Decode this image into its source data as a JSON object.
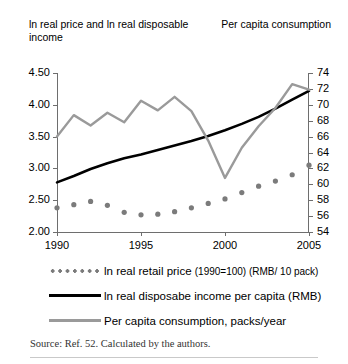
{
  "axis_captions": {
    "left": "ln real price and ln real disposable income",
    "right": "Per capita consumption"
  },
  "source_note": "Source: Ref. 52. Calculated by the authors.",
  "legend": [
    {
      "key": "dotted-marker",
      "label": "ln real retail price ",
      "sublabel": "(1990=100) (RMB/ 10 pack)",
      "color": "#7b7b7b"
    },
    {
      "key": "solid-black-line",
      "label": "ln real disposabe income per capita (RMB)",
      "sublabel": "",
      "color": "#000000"
    },
    {
      "key": "solid-gray-line",
      "label": "Per capita consumption, packs/year",
      "sublabel": "",
      "color": "#9a9a9a"
    }
  ],
  "chart_data": {
    "type": "line",
    "title": "",
    "xlabel": "",
    "ylabel": "ln real price and ln real disposable income",
    "y2label": "Per capita consumption",
    "grid": false,
    "legend_position": "bottom",
    "x": [
      1990,
      1991,
      1992,
      1993,
      1994,
      1995,
      1996,
      1997,
      1998,
      1999,
      2000,
      2001,
      2002,
      2003,
      2004,
      2005
    ],
    "xlim": [
      1990,
      2005
    ],
    "xticks": [
      1990,
      1995,
      2000,
      2005
    ],
    "xticklabels": [
      "1990",
      "1995",
      "2000",
      "2005"
    ],
    "ylim": [
      2.0,
      4.5
    ],
    "yticks": [
      2.0,
      2.5,
      3.0,
      3.5,
      4.0,
      4.5
    ],
    "yticklabels": [
      "2.00",
      "2.50",
      "3.00",
      "3.50",
      "4.00",
      "4.50"
    ],
    "y2lim": [
      54,
      74
    ],
    "y2ticks": [
      54,
      56,
      58,
      60,
      62,
      64,
      66,
      68,
      70,
      72,
      74
    ],
    "y2ticklabels": [
      "54",
      "56",
      "58",
      "60",
      "62",
      "64",
      "66",
      "68",
      "70",
      "72",
      "74"
    ],
    "series": [
      {
        "name": "ln real retail price (1990=100) (RMB/ 10 pack)",
        "axis": "left",
        "style": "dotted",
        "color": "#7b7b7b",
        "values": [
          2.38,
          2.43,
          2.48,
          2.42,
          2.31,
          2.27,
          2.28,
          2.32,
          2.38,
          2.45,
          2.52,
          2.62,
          2.72,
          2.8,
          2.9,
          3.05
        ]
      },
      {
        "name": "ln real disposabe income per capita (RMB)",
        "axis": "left",
        "style": "solid",
        "color": "#000000",
        "values": [
          2.78,
          2.88,
          2.99,
          3.08,
          3.16,
          3.22,
          3.29,
          3.36,
          3.43,
          3.51,
          3.6,
          3.7,
          3.81,
          3.94,
          4.08,
          4.22
        ]
      },
      {
        "name": "Per capita consumption, packs/year",
        "axis": "right",
        "style": "solid",
        "color": "#9a9a9a",
        "values": [
          66.0,
          68.7,
          67.4,
          69.0,
          67.8,
          70.5,
          69.3,
          71.0,
          69.2,
          65.5,
          60.8,
          64.6,
          67.3,
          69.6,
          72.6,
          71.9
        ]
      }
    ]
  }
}
